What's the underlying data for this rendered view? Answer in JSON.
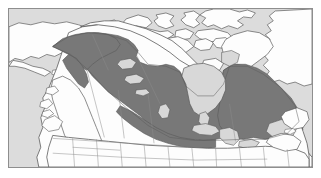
{
  "figure": {
    "kind": "thematic-map",
    "title": "",
    "caption": "",
    "frame": {
      "visible": true,
      "border_color": "#8e8e8e",
      "x": 8,
      "y": 8,
      "width": 305,
      "height": 160
    }
  },
  "map": {
    "region_name": "Canada and northern North America",
    "projection_hint": "conic",
    "palette": {
      "ocean": "#dcdcdc",
      "ocean_deep": "#d2d2d2",
      "land_unshaded": "#fdfdfd",
      "land_shaded": "#787878",
      "inland_water": "#d8d8d8",
      "coastline": "#5a5a5a",
      "border_line": "#8a8a8a",
      "frame": "#8e8e8e",
      "background": "#ffffff"
    },
    "shaded_theme": {
      "label": "",
      "description": "Shaded distribution range across the Canadian boreal interior, extending from interior Alaska and Yukon east through the Northwest Territories, northern Prairie provinces, Ontario, Quebec and Labrador",
      "fill": "#787878"
    },
    "unshaded_theme": {
      "label": "",
      "description": "Areas outside the shaded range: Alaska, the Arctic Archipelago, Greenland, southern British Columbia and the contiguous United States",
      "fill": "#fdfdfd"
    },
    "features": [
      {
        "name": "pacific-ocean",
        "type": "ocean"
      },
      {
        "name": "arctic-ocean",
        "type": "ocean"
      },
      {
        "name": "atlantic-ocean",
        "type": "ocean"
      },
      {
        "name": "hudson-bay",
        "type": "inland-water"
      },
      {
        "name": "great-lakes",
        "type": "inland-water"
      },
      {
        "name": "great-bear-lake",
        "type": "inland-water"
      },
      {
        "name": "great-slave-lake",
        "type": "inland-water"
      },
      {
        "name": "lake-winnipeg",
        "type": "inland-water"
      },
      {
        "name": "alaska",
        "type": "land-unshaded"
      },
      {
        "name": "greenland",
        "type": "land-unshaded"
      },
      {
        "name": "arctic-archipelago",
        "type": "land-unshaded"
      },
      {
        "name": "baffin-island",
        "type": "land-unshaded"
      },
      {
        "name": "victoria-island",
        "type": "land-unshaded"
      },
      {
        "name": "banks-island",
        "type": "land-unshaded"
      },
      {
        "name": "ellesmere-island",
        "type": "land-unshaded"
      },
      {
        "name": "newfoundland",
        "type": "land-unshaded"
      },
      {
        "name": "vancouver-island",
        "type": "land-unshaded"
      },
      {
        "name": "haida-gwaii",
        "type": "land-unshaded"
      },
      {
        "name": "contiguous-united-states",
        "type": "land-unshaded"
      },
      {
        "name": "boreal-shaded-range",
        "type": "land-shaded"
      }
    ],
    "internal_borders": {
      "visible": true,
      "description": "Thin political boundary lines between United States states and between Canadian provinces in unshaded areas"
    }
  }
}
